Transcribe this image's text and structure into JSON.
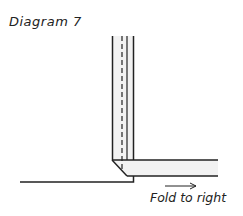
{
  "diagram": {
    "title": "Diagram 7",
    "caption": "Fold to right",
    "arrow_direction": "right",
    "colors": {
      "line": "#222222",
      "fill": "#f2f2f2",
      "background": "#ffffff"
    }
  }
}
